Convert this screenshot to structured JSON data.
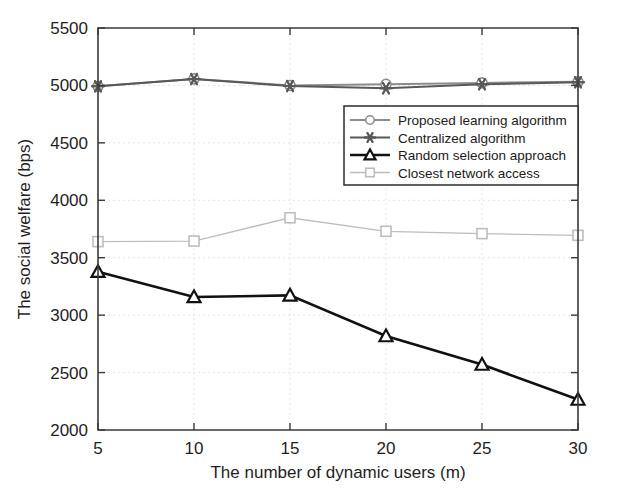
{
  "chart_data": {
    "type": "line",
    "title": "",
    "xlabel": "The number of dynamic users (m)",
    "ylabel": "The social welfare (bps)",
    "x": [
      5,
      10,
      15,
      20,
      25,
      30
    ],
    "xtick_labels": [
      "5",
      "10",
      "15",
      "20",
      "25",
      "30"
    ],
    "ytick_labels": [
      "2000",
      "2500",
      "3000",
      "3500",
      "4000",
      "4500",
      "5000",
      "5500"
    ],
    "yticks": [
      2000,
      2500,
      3000,
      3500,
      4000,
      4500,
      5000,
      5500
    ],
    "xlim": [
      5,
      30
    ],
    "ylim": [
      2000,
      5500
    ],
    "grid": true,
    "legend_position": "center-right",
    "series": [
      {
        "name": "Proposed learning algorithm",
        "marker": "circle",
        "color": "#8c8c8c",
        "values": [
          4992,
          5057,
          5000,
          5010,
          5022,
          5031
        ]
      },
      {
        "name": "Centralized algorithm",
        "marker": "star",
        "color": "#595959",
        "values": [
          4992,
          5055,
          4995,
          4976,
          5010,
          5028
        ]
      },
      {
        "name": "Random selection approach",
        "marker": "triangle",
        "color": "#111111",
        "values": [
          3378,
          3158,
          3172,
          2818,
          2570,
          2265
        ]
      },
      {
        "name": "Closest network access",
        "marker": "square",
        "color": "#bdbdbd",
        "values": [
          3640,
          3645,
          3848,
          3730,
          3710,
          3695
        ]
      }
    ]
  },
  "axes": {
    "x_title": "The number of dynamic users (m)",
    "y_title": "The social welfare (bps)"
  },
  "legend": {
    "entries": [
      {
        "label": "Proposed learning algorithm",
        "marker": "circle-marker",
        "color": "#8c8c8c"
      },
      {
        "label": "Centralized algorithm",
        "marker": "star-marker",
        "color": "#595959"
      },
      {
        "label": "Random selection approach",
        "marker": "triangle-marker",
        "color": "#111111"
      },
      {
        "label": "Closest network access",
        "marker": "square-marker",
        "color": "#bdbdbd"
      }
    ]
  }
}
